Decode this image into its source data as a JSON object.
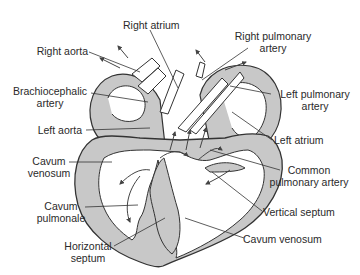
{
  "diagram": {
    "colors": {
      "wall_fill": "#c8c8c8",
      "outline": "#333333",
      "chamber_fill": "#ffffff",
      "text": "#2a2a2a"
    },
    "labels": {
      "right_atrium": "Right atrium",
      "right_pulmonary_artery_l1": "Right pulmonary",
      "right_pulmonary_artery_l2": "artery",
      "right_aorta": "Right aorta",
      "brachiocephalic_l1": "Brachiocephalic",
      "brachiocephalic_l2": "artery",
      "left_pulmonary_artery_l1": "Left pulmonary",
      "left_pulmonary_artery_l2": "artery",
      "left_aorta": "Left aorta",
      "left_atrium": "Left atrium",
      "cavum_venosum_left_l1": "Cavum",
      "cavum_venosum_left_l2": "venosum",
      "common_pulmonary_artery_l1": "Common",
      "common_pulmonary_artery_l2": "pulmonary artery",
      "cavum_pulmonale_l1": "Cavum",
      "cavum_pulmonale_l2": "pulmonale",
      "vertical_septum": "Vertical septum",
      "horizontal_septum_l1": "Horizontal",
      "horizontal_septum_l2": "septum",
      "cavum_venosum_right": "Cavum venosum"
    }
  }
}
